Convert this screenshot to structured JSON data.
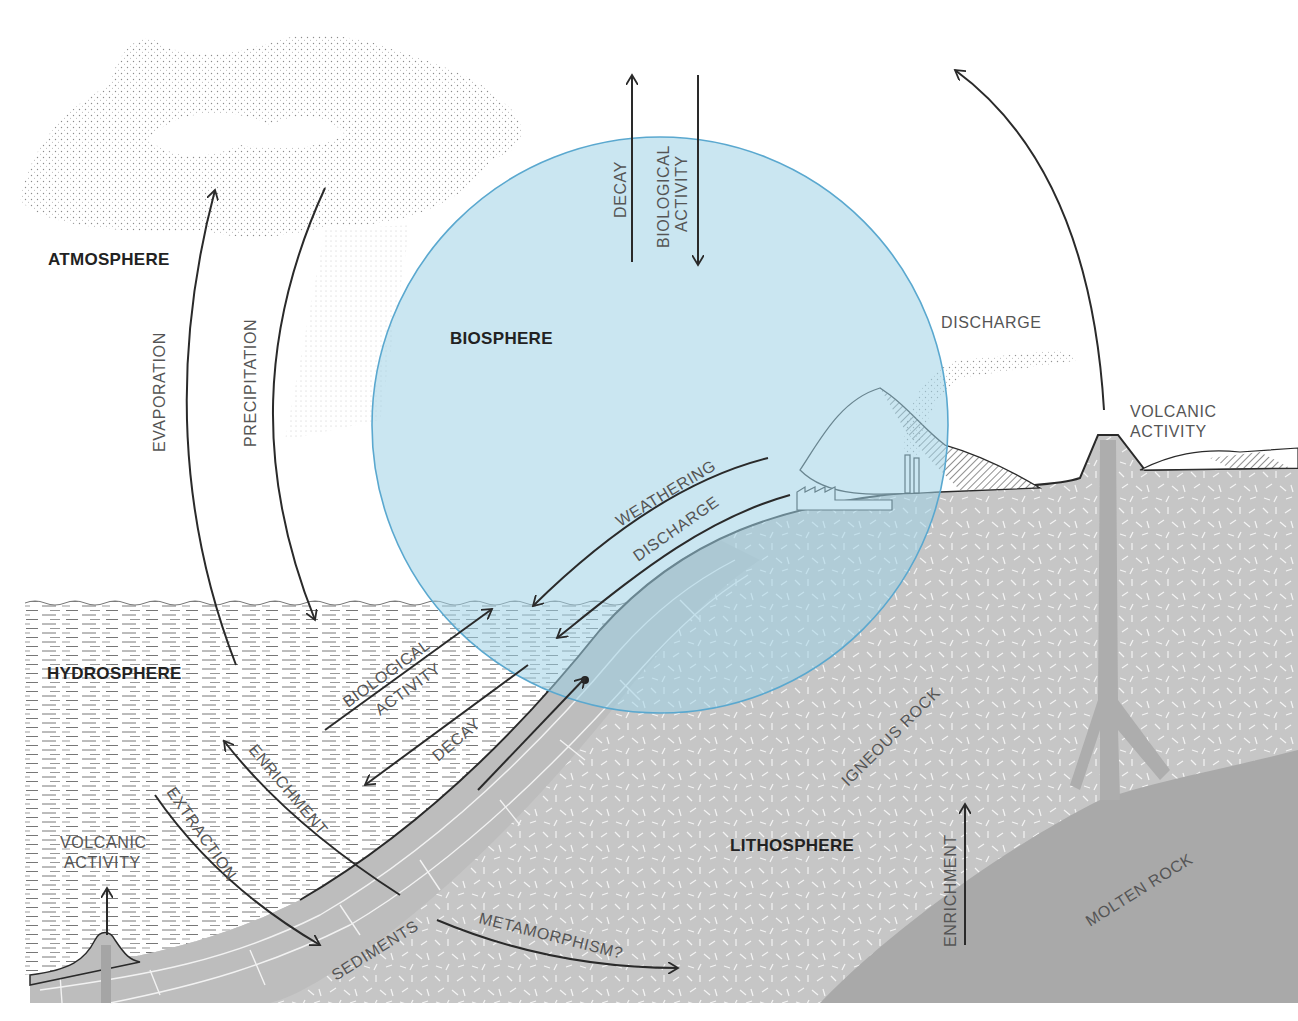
{
  "page_number": "81",
  "spheres": {
    "atmosphere": "ATMOSPHERE",
    "biosphere": "BIOSPHERE",
    "hydrosphere": "HYDROSPHERE",
    "lithosphere": "LITHOSPHERE"
  },
  "processes": {
    "decay_top": "DECAY",
    "biological_activity_top_1": "BIOLOGICAL",
    "biological_activity_top_2": "ACTIVITY",
    "evaporation": "EVAPORATION",
    "precipitation": "PRECIPITATION",
    "discharge_air": "DISCHARGE",
    "volcanic_activity_right_1": "VOLCANIC",
    "volcanic_activity_right_2": "ACTIVITY",
    "weathering": "WEATHERING",
    "discharge_land": "DISCHARGE",
    "biological_activity_sea_1": "BIOLOGICAL",
    "biological_activity_sea_2": "ACTIVITY",
    "decay_sea": "DECAY",
    "enrichment_sea": "ENRICHMENT",
    "extraction": "EXTRACTION",
    "volcanic_activity_left_1": "VOLCANIC",
    "volcanic_activity_left_2": "ACTIVITY",
    "sediments": "SEDIMENTS",
    "metamorphism": "METAMORPHISM?",
    "igneous_rock": "IGNEOUS ROCK",
    "enrichment_magma": "ENRICHMENT",
    "molten_rock": "MOLTEN ROCK"
  },
  "colors": {
    "biosphere_fill": "#bfe1ee",
    "biosphere_stroke": "#5aa8cf",
    "rock_gray": "#c9c9c9",
    "molten_gray": "#a9a9a9",
    "sediment_gray": "#bdbdbd",
    "line": "#2a2a2a",
    "label_minor": "#555555",
    "label_major": "#222222"
  }
}
